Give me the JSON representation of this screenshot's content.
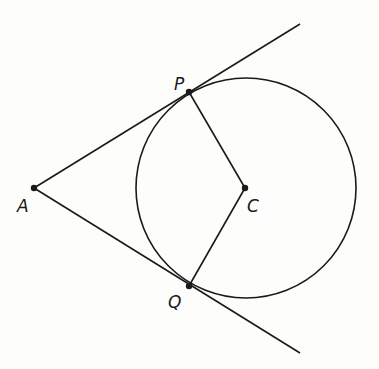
{
  "diagram": {
    "colors": {
      "stroke": "#1a1a1a",
      "background": "#fdfdfc"
    },
    "points": {
      "A": {
        "label": "A",
        "x": 34,
        "y": 188
      },
      "P": {
        "label": "P",
        "x": 189,
        "y": 92
      },
      "C": {
        "label": "C",
        "x": 245,
        "y": 188
      },
      "Q": {
        "label": "Q",
        "x": 189,
        "y": 286
      }
    },
    "circle": {
      "center": "C",
      "cx": 246,
      "cy": 188,
      "r": 110
    },
    "segments": [
      {
        "from": "A",
        "to": "P",
        "extends_to": [
          300,
          24
        ]
      },
      {
        "from": "A",
        "to": "Q",
        "extends_to": [
          300,
          353
        ]
      },
      {
        "from": "P",
        "to": "C"
      },
      {
        "from": "C",
        "to": "Q"
      }
    ]
  }
}
